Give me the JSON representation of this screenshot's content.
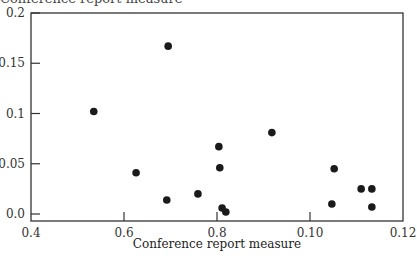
{
  "chart_data": {
    "type": "scatter",
    "title": "",
    "top_label_partial": "Conference report measure",
    "xlabel": "Conference report measure",
    "ylabel": "",
    "xlim": [
      0.4,
      1.2
    ],
    "ylim": [
      0.0,
      0.2
    ],
    "x_ticks": [
      0.4,
      0.6,
      0.8,
      1.0,
      1.2
    ],
    "x_tick_labels": [
      "0.4",
      "0.6",
      "0.8",
      "0.10",
      "0.12"
    ],
    "y_ticks": [
      0.0,
      0.05,
      0.1,
      0.15,
      0.2
    ],
    "y_tick_labels": [
      "0.0",
      "0.05",
      "0.1",
      "0.15",
      "0.2"
    ],
    "grid": false,
    "legend": null,
    "marker_color": "#1a1a1a",
    "points": [
      {
        "x": 0.535,
        "y": 0.102
      },
      {
        "x": 0.626,
        "y": 0.041
      },
      {
        "x": 0.692,
        "y": 0.014
      },
      {
        "x": 0.695,
        "y": 0.167
      },
      {
        "x": 0.759,
        "y": 0.02
      },
      {
        "x": 0.804,
        "y": 0.067
      },
      {
        "x": 0.806,
        "y": 0.046
      },
      {
        "x": 0.811,
        "y": 0.006
      },
      {
        "x": 0.819,
        "y": 0.002
      },
      {
        "x": 0.918,
        "y": 0.081
      },
      {
        "x": 1.047,
        "y": 0.01
      },
      {
        "x": 1.052,
        "y": 0.045
      },
      {
        "x": 1.11,
        "y": 0.025
      },
      {
        "x": 1.133,
        "y": 0.025
      },
      {
        "x": 1.133,
        "y": 0.007
      }
    ]
  }
}
